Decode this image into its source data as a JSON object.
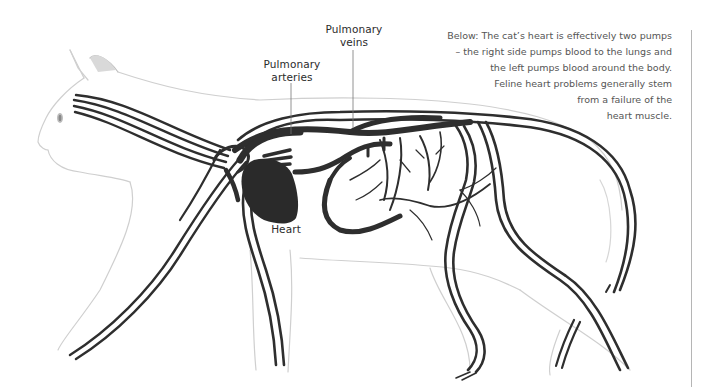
{
  "figure": {
    "labels": {
      "pulmonary_veins": [
        "Pulmonary",
        "veins"
      ],
      "pulmonary_arteries": [
        "Pulmonary",
        "arteries"
      ],
      "heart": "Heart"
    },
    "caption_lines": [
      "Below: The cat’s heart is effectively two pumps",
      "– the right side pumps blood to the lungs and",
      "the left pumps blood around the body.",
      "Feline heart problems generally stem",
      "from a failure of the",
      "heart muscle."
    ],
    "colors": {
      "vessel": "#2e2e2e",
      "cat_outline": "#c8c8c8",
      "cat_shading": "#e4e4e4",
      "text": "#2b2b2b",
      "caption_text": "#555555",
      "rule": "#b5b5b5"
    }
  }
}
